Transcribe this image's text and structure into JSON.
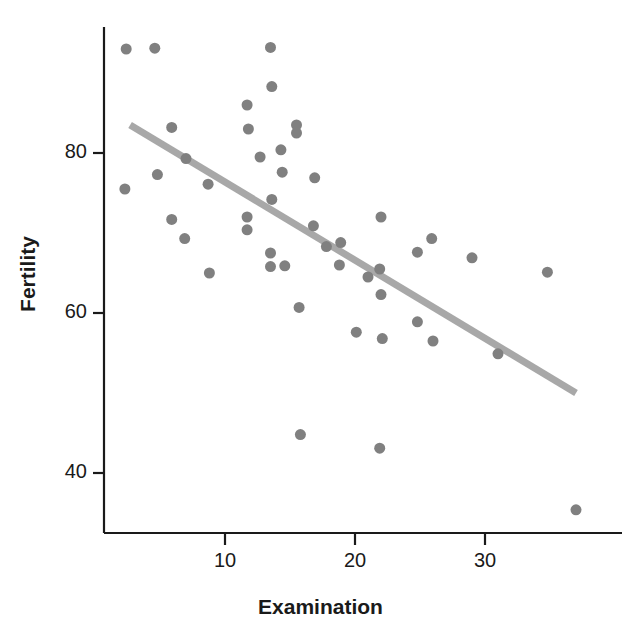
{
  "chart_data": {
    "type": "scatter",
    "title": "",
    "xlabel": "Examination",
    "ylabel": "Fertility",
    "xlim": [
      1.5,
      38.5
    ],
    "ylim": [
      33.0,
      94.5
    ],
    "xticks": [
      10,
      20,
      30
    ],
    "xtick_labels": [
      "10",
      "20",
      "30"
    ],
    "yticks": [
      40,
      60,
      80
    ],
    "ytick_labels": [
      "40",
      "60",
      "80"
    ],
    "grid": false,
    "legend": "none",
    "marker": {
      "shape": "circle",
      "color": "#808080",
      "size_px": 11
    },
    "trendline": {
      "type": "linear-fit",
      "color": "#a8a8a8",
      "width_px": 7,
      "x_start": 2.7,
      "y_start": 83.5,
      "x_end": 37.0,
      "y_end": 50.0
    },
    "points": [
      {
        "x": 2.4,
        "y": 93.0
      },
      {
        "x": 4.6,
        "y": 93.1
      },
      {
        "x": 13.5,
        "y": 93.2
      },
      {
        "x": 13.6,
        "y": 88.3
      },
      {
        "x": 11.7,
        "y": 86.0
      },
      {
        "x": 5.9,
        "y": 83.2
      },
      {
        "x": 11.8,
        "y": 83.0
      },
      {
        "x": 15.5,
        "y": 83.5
      },
      {
        "x": 15.5,
        "y": 82.5
      },
      {
        "x": 14.3,
        "y": 80.4
      },
      {
        "x": 12.7,
        "y": 79.5
      },
      {
        "x": 7.0,
        "y": 79.3
      },
      {
        "x": 14.4,
        "y": 77.6
      },
      {
        "x": 16.9,
        "y": 76.9
      },
      {
        "x": 4.8,
        "y": 77.3
      },
      {
        "x": 8.7,
        "y": 76.1
      },
      {
        "x": 2.3,
        "y": 75.5
      },
      {
        "x": 13.6,
        "y": 74.2
      },
      {
        "x": 11.7,
        "y": 72.0
      },
      {
        "x": 5.9,
        "y": 71.7
      },
      {
        "x": 22.0,
        "y": 72.0
      },
      {
        "x": 16.8,
        "y": 70.9
      },
      {
        "x": 11.7,
        "y": 70.4
      },
      {
        "x": 6.9,
        "y": 69.3
      },
      {
        "x": 25.9,
        "y": 69.3
      },
      {
        "x": 18.9,
        "y": 68.8
      },
      {
        "x": 17.8,
        "y": 68.3
      },
      {
        "x": 24.8,
        "y": 67.6
      },
      {
        "x": 13.5,
        "y": 67.5
      },
      {
        "x": 29.0,
        "y": 66.9
      },
      {
        "x": 18.8,
        "y": 66.0
      },
      {
        "x": 14.6,
        "y": 65.9
      },
      {
        "x": 13.5,
        "y": 65.8
      },
      {
        "x": 8.8,
        "y": 65.0
      },
      {
        "x": 21.9,
        "y": 65.5
      },
      {
        "x": 34.8,
        "y": 65.1
      },
      {
        "x": 21.0,
        "y": 64.5
      },
      {
        "x": 22.0,
        "y": 62.3
      },
      {
        "x": 15.7,
        "y": 60.7
      },
      {
        "x": 24.8,
        "y": 58.9
      },
      {
        "x": 20.1,
        "y": 57.6
      },
      {
        "x": 26.0,
        "y": 56.5
      },
      {
        "x": 22.1,
        "y": 56.8
      },
      {
        "x": 31.0,
        "y": 54.9
      },
      {
        "x": 15.8,
        "y": 44.8
      },
      {
        "x": 21.9,
        "y": 43.1
      },
      {
        "x": 37.0,
        "y": 35.4
      }
    ]
  },
  "axes": {
    "y_title": "Fertility",
    "x_title": "Examination"
  }
}
